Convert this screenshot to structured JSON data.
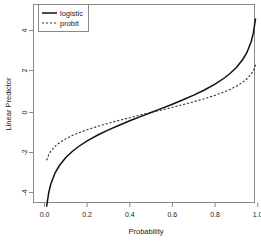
{
  "chart_data": {
    "type": "line",
    "title": "",
    "xlabel": "Probability",
    "ylabel": "Linear Predictor",
    "xlim": [
      0.0,
      1.0
    ],
    "ylim": [
      -4.6,
      4.6
    ],
    "grid": false,
    "legend_position": "top-left",
    "x_ticks": [
      "0.0",
      "0.2",
      "0.4",
      "0.6",
      "0.8",
      "1.0"
    ],
    "x_tick_values": [
      0.0,
      0.2,
      0.4,
      0.6,
      0.8,
      1.0
    ],
    "y_ticks": [
      "4",
      "2",
      "0",
      "-2",
      "-4"
    ],
    "y_tick_values": [
      4,
      2,
      0,
      -2,
      -4
    ],
    "x": [
      0.01,
      0.02,
      0.03,
      0.05,
      0.07,
      0.1,
      0.13,
      0.16,
      0.2,
      0.25,
      0.3,
      0.35,
      0.4,
      0.45,
      0.5,
      0.55,
      0.6,
      0.65,
      0.7,
      0.75,
      0.8,
      0.84,
      0.87,
      0.9,
      0.93,
      0.95,
      0.97,
      0.98,
      0.99
    ],
    "series": [
      {
        "name": "logistic",
        "style": "solid",
        "color": "#111111",
        "values": [
          -4.595,
          -3.892,
          -3.476,
          -2.944,
          -2.587,
          -2.197,
          -1.901,
          -1.658,
          -1.386,
          -1.099,
          -0.847,
          -0.619,
          -0.405,
          -0.201,
          0.0,
          0.201,
          0.405,
          0.619,
          0.847,
          1.099,
          1.386,
          1.658,
          1.901,
          2.197,
          2.587,
          2.944,
          3.476,
          3.892,
          4.595
        ]
      },
      {
        "name": "probit",
        "style": "dashed",
        "color": "#333333",
        "values": [
          -2.326,
          -2.054,
          -1.881,
          -1.645,
          -1.476,
          -1.282,
          -1.126,
          -0.994,
          -0.842,
          -0.674,
          -0.524,
          -0.385,
          -0.253,
          -0.126,
          0.0,
          0.126,
          0.253,
          0.385,
          0.524,
          0.674,
          0.842,
          0.994,
          1.126,
          1.282,
          1.476,
          1.645,
          1.881,
          2.054,
          2.326
        ]
      }
    ]
  },
  "legend": {
    "entries": [
      {
        "label": "logistic"
      },
      {
        "label": "probit"
      }
    ]
  }
}
